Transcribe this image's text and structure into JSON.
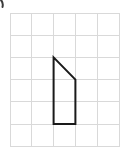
{
  "figure": {
    "canvas": {
      "width": 128,
      "height": 157,
      "background_color": "#ffffff"
    },
    "grid": {
      "columns": 5,
      "rows": 6,
      "cell_width": 21.8,
      "cell_height": 22.2,
      "origin_x": 10,
      "origin_y": 13,
      "line_color": "#d9d9d9",
      "line_width": 1,
      "x_positions": [
        10,
        31.8,
        53.6,
        75.4,
        97.2,
        119
      ],
      "y_positions": [
        13,
        35.2,
        57.4,
        79.6,
        101.8,
        124,
        146.2
      ]
    },
    "shape": {
      "name": "right-trapezoid",
      "stroke_color": "#1a1a1a",
      "stroke_width": 2,
      "fill": "none",
      "vertex_count": 4,
      "vertices": [
        {
          "label": "A",
          "x": 53.6,
          "y": 57.4,
          "grid_col": 2,
          "grid_row": 2
        },
        {
          "label": "B",
          "x": 75.4,
          "y": 79.6,
          "grid_col": 3,
          "grid_row": 3
        },
        {
          "label": "C",
          "x": 75.4,
          "y": 124.0,
          "grid_col": 3,
          "grid_row": 5
        },
        {
          "label": "D",
          "x": 53.6,
          "y": 124.0,
          "grid_col": 2,
          "grid_row": 5
        }
      ],
      "edges": [
        {
          "from": "A",
          "to": "B",
          "type": "diagonal"
        },
        {
          "from": "B",
          "to": "C",
          "type": "vertical"
        },
        {
          "from": "C",
          "to": "D",
          "type": "horizontal"
        },
        {
          "from": "D",
          "to": "A",
          "type": "vertical"
        }
      ],
      "path": "M 53.6 57.4 L 75.4 79.6 L 75.4 124 L 53.6 124 Z"
    },
    "artifact": {
      "name": "corner-scan-mark",
      "color": "#3a3a3a",
      "path": "M 1 0 Q 3.5 3 2.5 7"
    }
  }
}
